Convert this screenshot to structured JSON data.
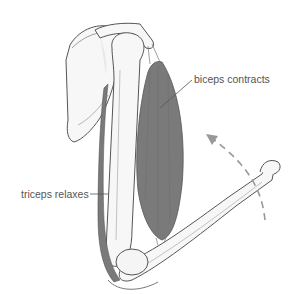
{
  "diagram": {
    "labels": {
      "biceps": "biceps contracts",
      "triceps": "triceps relaxes"
    },
    "colors": {
      "muscle": "#7a7a7a",
      "bone_fill": "#f7f7f7",
      "bone_outline": "#555555",
      "leader_line": "#555555",
      "arrow": "#999999",
      "text": "#555555"
    },
    "arrow": {
      "style": "dashed curved",
      "direction": "upward (flexion)"
    }
  }
}
